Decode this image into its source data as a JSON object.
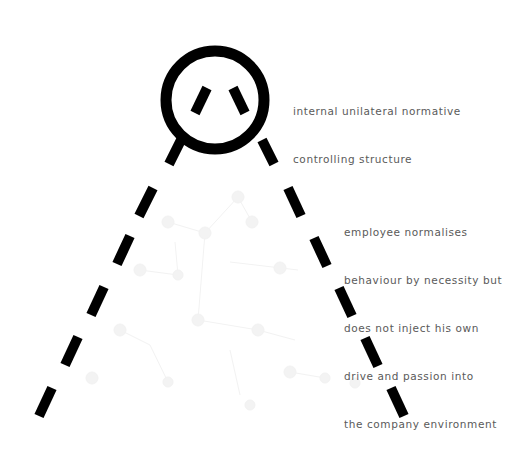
{
  "annotations": {
    "structure": {
      "lines": [
        "internal unilateral normative",
        "controlling structure"
      ]
    },
    "employee": {
      "lines": [
        "employee normalises",
        "behaviour by necessity but",
        "does not inject his own",
        "drive and passion into",
        "the company environment"
      ]
    }
  },
  "colors": {
    "ink": "#000000",
    "text": "#5a5a5a",
    "background_network": "#f4f4f4"
  }
}
